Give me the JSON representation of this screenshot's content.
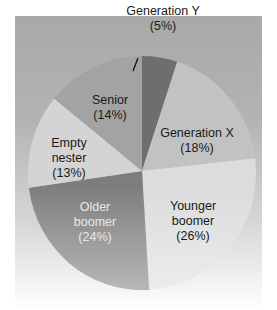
{
  "chart_data": {
    "type": "pie",
    "title": "",
    "start_angle_deg": 0,
    "direction": "clockwise",
    "slices": [
      {
        "label": "Generation Y",
        "value": 5,
        "pct_label": "(5%)",
        "color": "#6e6e6e"
      },
      {
        "label": "Generation X",
        "value": 18,
        "pct_label": "(18%)",
        "color": "#c2c2c2"
      },
      {
        "label": "Younger boomer",
        "value": 26,
        "pct_label": "(26%)",
        "color": "#dcdcdc"
      },
      {
        "label": "Older boomer",
        "value": 24,
        "pct_label": "(24%)",
        "color": "#7d7d7d"
      },
      {
        "label": "Empty nester",
        "value": 13,
        "pct_label": "(13%)",
        "color": "#d4d4d4"
      },
      {
        "label": "Senior",
        "value": 14,
        "pct_label": "(14%)",
        "color": "#a3a3a3"
      }
    ],
    "categories": [
      "Generation Y",
      "Generation X",
      "Younger boomer",
      "Older boomer",
      "Empty nester",
      "Senior"
    ],
    "values": [
      5,
      18,
      26,
      24,
      13,
      14
    ],
    "legend": "none (labels on slices)",
    "units": "%"
  },
  "labels": {
    "gen_y": {
      "line1": "Generation Y",
      "line2": "(5%)"
    },
    "gen_x": {
      "line1": "Generation X",
      "line2": "(18%)"
    },
    "younger_boomer": {
      "line1": "Younger",
      "line2": "boomer",
      "line3": "(26%)"
    },
    "older_boomer": {
      "line1": "Older",
      "line2": "boomer",
      "line3": "(24%)"
    },
    "empty_nester": {
      "line1": "Empty",
      "line2": "nester",
      "line3": "(13%)"
    },
    "senior": {
      "line1": "Senior",
      "line2": "(14%)"
    }
  }
}
